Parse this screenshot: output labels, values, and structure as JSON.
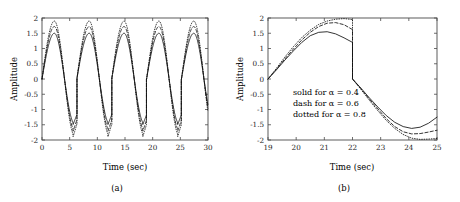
{
  "figure": {
    "caption_a": "(a)",
    "caption_b": "(b)"
  },
  "panel_a": {
    "xlabel": "Time (sec)",
    "ylabel": "Amplitude",
    "xticks": [
      "0",
      "5",
      "10",
      "15",
      "20",
      "25",
      "30"
    ],
    "yticks": [
      "2",
      "1.5",
      "1",
      "0.5",
      "0",
      "-0.5",
      "-1",
      "-1.5",
      "-2"
    ]
  },
  "panel_b": {
    "xlabel": "Time (sec)",
    "ylabel": "Amplitude",
    "xticks": [
      "19",
      "20",
      "21",
      "22",
      "23",
      "24",
      "25"
    ],
    "yticks": [
      "2",
      "1.5",
      "1",
      "0.5",
      "0",
      "-0.5",
      "-1",
      "-1.5",
      "-2"
    ],
    "legend": [
      "solid for α = 0.4",
      "dash for α = 0.6",
      "dotted for α = 0.8"
    ]
  },
  "chart_data": [
    {
      "type": "line",
      "id": "panel-a",
      "title": "",
      "xlabel": "Time (sec)",
      "ylabel": "Amplitude",
      "xlim": [
        0,
        30
      ],
      "ylim": [
        -2,
        2
      ],
      "xticks": [
        0,
        5,
        10,
        15,
        20,
        25,
        30
      ],
      "yticks": [
        2,
        1.5,
        1,
        0.5,
        0,
        -0.5,
        -1,
        -1.5,
        -2
      ],
      "grid": false,
      "legend_position": "none",
      "period": 6.3,
      "description": "Periodic sawtooth-like oscillation, ~4.7 cycles over 0-30 sec. Each cycle rises smoothly from 0 to a rounded peak near t=phase+2.2, decays through zero to a sharp V-shaped trough near phase+5.6, then jumps vertically back to 0 at the cycle end.",
      "series": [
        {
          "name": "solid for α = 0.4",
          "style": "solid",
          "peak": 1.5,
          "trough": -1.55,
          "x": [
            0.0,
            0.6,
            1.2,
            1.8,
            2.2,
            2.6,
            3.0,
            3.4,
            3.8,
            4.4,
            5.0,
            5.4,
            5.8,
            6.1,
            6.3,
            6.3,
            6.9,
            7.5,
            8.1,
            8.5,
            8.9,
            9.3,
            9.7,
            10.1,
            10.7,
            11.3,
            11.7,
            12.1,
            12.4,
            12.6,
            12.6,
            13.2,
            13.8,
            14.4,
            14.8,
            15.2,
            15.6,
            16.0,
            16.4,
            17.0,
            17.6,
            18.0,
            18.4,
            18.7,
            18.9,
            18.9,
            19.5,
            20.1,
            20.7,
            21.1,
            21.5,
            21.9,
            22.3,
            22.7,
            23.3,
            23.9,
            24.3,
            24.7,
            25.0,
            25.2,
            25.2,
            25.8,
            26.4,
            27.0,
            27.4,
            27.8,
            28.2,
            28.6,
            29.0,
            29.6,
            30.0
          ],
          "y": [
            0.0,
            0.55,
            1.05,
            1.38,
            1.5,
            1.45,
            1.25,
            0.95,
            0.6,
            0.0,
            -0.7,
            -1.15,
            -1.45,
            -1.55,
            -1.3,
            0.0,
            0.55,
            1.05,
            1.38,
            1.5,
            1.45,
            1.25,
            0.95,
            0.6,
            0.0,
            -0.7,
            -1.15,
            -1.45,
            -1.55,
            -1.3,
            0.0,
            0.55,
            1.05,
            1.38,
            1.5,
            1.45,
            1.25,
            0.95,
            0.6,
            0.0,
            -0.7,
            -1.15,
            -1.45,
            -1.55,
            -1.3,
            0.0,
            0.55,
            1.05,
            1.38,
            1.5,
            1.45,
            1.25,
            0.95,
            0.6,
            0.0,
            -0.7,
            -1.15,
            -1.45,
            -1.55,
            -1.3,
            0.0,
            0.55,
            1.05,
            1.38,
            1.5,
            1.45,
            1.25,
            0.95,
            0.6,
            0.0,
            -0.5
          ]
        },
        {
          "name": "dash for α = 0.6",
          "style": "dash",
          "peak": 1.72,
          "trough": -1.78
        },
        {
          "name": "dotted for α = 0.8",
          "style": "dotted",
          "peak": 1.9,
          "trough": -1.95
        }
      ]
    },
    {
      "type": "line",
      "id": "panel-b",
      "title": "",
      "xlabel": "Time (sec)",
      "ylabel": "Amplitude",
      "xlim": [
        19,
        25
      ],
      "ylim": [
        -2,
        2
      ],
      "xticks": [
        19,
        20,
        21,
        22,
        23,
        24,
        25
      ],
      "yticks": [
        2,
        1.5,
        1,
        0.5,
        0,
        -0.5,
        -1,
        -1.5,
        -2
      ],
      "grid": false,
      "legend_position": "lower-left-inset",
      "description": "Zoomed view of one cycle (t = 19 to 25). Three curves rise together from 0 at t=19, diverge approaching the peak near t=21, drop discontinuously at t=22 to 0, then descend to troughs near t=24 before turning upward.",
      "series": [
        {
          "name": "solid for α = 0.4",
          "style": "solid",
          "alpha": 0.4,
          "peak": 1.55,
          "value_before_jump": 1.2,
          "trough": -1.62,
          "x": [
            19.0,
            19.3,
            19.6,
            19.9,
            20.2,
            20.5,
            20.8,
            21.1,
            21.4,
            21.7,
            22.0,
            22.0,
            22.3,
            22.6,
            22.9,
            23.2,
            23.5,
            23.8,
            24.1,
            24.4,
            24.7,
            25.0
          ],
          "y": [
            0.0,
            0.3,
            0.62,
            0.92,
            1.2,
            1.42,
            1.53,
            1.55,
            1.48,
            1.35,
            1.2,
            0.0,
            -0.3,
            -0.62,
            -0.92,
            -1.2,
            -1.42,
            -1.56,
            -1.62,
            -1.58,
            -1.45,
            -1.25
          ]
        },
        {
          "name": "dash for α = 0.6",
          "style": "dash",
          "alpha": 0.6,
          "peak": 1.85,
          "value_before_jump": 1.62,
          "trough": -1.8,
          "x": [
            19.0,
            19.3,
            19.6,
            19.9,
            20.2,
            20.5,
            20.8,
            21.1,
            21.4,
            21.7,
            22.0,
            22.0,
            22.3,
            22.6,
            22.9,
            23.2,
            23.5,
            23.8,
            24.1,
            24.4,
            24.7,
            25.0
          ],
          "y": [
            0.0,
            0.32,
            0.66,
            0.98,
            1.28,
            1.53,
            1.72,
            1.83,
            1.85,
            1.78,
            1.62,
            0.0,
            -0.32,
            -0.66,
            -0.98,
            -1.3,
            -1.56,
            -1.73,
            -1.8,
            -1.79,
            -1.74,
            -1.68
          ]
        },
        {
          "name": "dotted for α = 0.8",
          "style": "dotted",
          "alpha": 0.8,
          "peak": 1.98,
          "value_before_jump": 1.95,
          "trough": -1.97,
          "x": [
            19.0,
            19.3,
            19.6,
            19.9,
            20.2,
            20.5,
            20.8,
            21.1,
            21.4,
            21.7,
            22.0,
            22.0,
            22.3,
            22.6,
            22.9,
            23.2,
            23.5,
            23.8,
            24.1,
            24.4,
            24.7,
            25.0
          ],
          "y": [
            0.0,
            0.35,
            0.72,
            1.06,
            1.36,
            1.6,
            1.79,
            1.9,
            1.96,
            1.98,
            1.95,
            0.0,
            -0.34,
            -0.7,
            -1.04,
            -1.36,
            -1.62,
            -1.82,
            -1.94,
            -1.98,
            -1.97,
            -1.95
          ]
        }
      ]
    }
  ]
}
